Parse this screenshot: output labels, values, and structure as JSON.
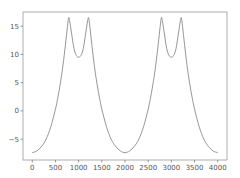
{
  "chart_data": {
    "type": "line",
    "title": "",
    "xlabel": "",
    "ylabel": "",
    "xlim": [
      -200,
      4200
    ],
    "ylim": [
      -8.7,
      17.5
    ],
    "grid": false,
    "legend": null,
    "xticks": [
      0,
      500,
      1000,
      1500,
      2000,
      2500,
      3000,
      3500,
      4000
    ],
    "xtick_labels": [
      "0",
      "500",
      "1000",
      "1500",
      "2000",
      "2500",
      "3000",
      "3500",
      "4000"
    ],
    "yticks": [
      -5,
      0,
      5,
      10,
      15
    ],
    "ytick_labels": [
      "−5",
      "0",
      "5",
      "10",
      "15"
    ],
    "series": [
      {
        "name": "series",
        "color": "#8a8a8a",
        "x": [
          0,
          100,
          200,
          300,
          400,
          500,
          550,
          600,
          650,
          700,
          750,
          780,
          800,
          850,
          900,
          950,
          1000,
          1050,
          1100,
          1150,
          1200,
          1220,
          1250,
          1300,
          1350,
          1400,
          1450,
          1500,
          1600,
          1700,
          1800,
          1900,
          2000,
          2100,
          2200,
          2300,
          2400,
          2500,
          2550,
          2600,
          2650,
          2700,
          2750,
          2780,
          2800,
          2850,
          2900,
          2950,
          3000,
          3050,
          3100,
          3150,
          3200,
          3220,
          3250,
          3300,
          3350,
          3400,
          3450,
          3500,
          3600,
          3700,
          3800,
          3900,
          4000
        ],
        "y": [
          -7.4,
          -7.1,
          -6.3,
          -5.0,
          -2.8,
          0.3,
          2.3,
          4.6,
          7.3,
          10.6,
          14.3,
          16.3,
          16.2,
          13.6,
          11.0,
          9.8,
          9.5,
          9.8,
          11.0,
          13.6,
          16.2,
          16.3,
          14.3,
          10.6,
          7.3,
          4.6,
          2.3,
          0.3,
          -2.8,
          -5.0,
          -6.3,
          -7.1,
          -7.4,
          -7.1,
          -6.3,
          -5.0,
          -2.8,
          0.3,
          2.3,
          4.6,
          7.3,
          10.6,
          14.3,
          16.3,
          16.2,
          13.6,
          11.0,
          9.8,
          9.5,
          9.8,
          11.0,
          13.6,
          16.2,
          16.3,
          14.3,
          10.6,
          7.3,
          4.6,
          2.3,
          0.3,
          -2.8,
          -5.0,
          -6.3,
          -7.1,
          -7.4
        ]
      }
    ]
  },
  "style": {
    "frame_color": "#9a9a9a",
    "tick_color": "#555555"
  }
}
